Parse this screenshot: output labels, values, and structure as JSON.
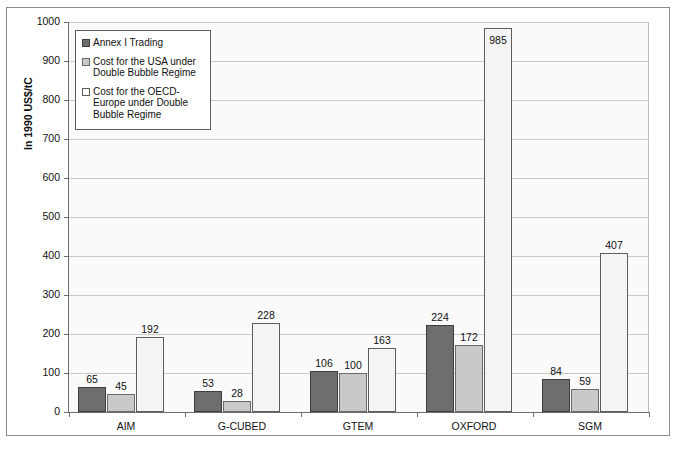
{
  "chart_data": {
    "type": "bar",
    "title": "",
    "xlabel": "",
    "ylabel": "In 1990 US$/tC",
    "ylim": [
      0,
      1000
    ],
    "ytick_step": 100,
    "yticks": [
      "0",
      "100",
      "200",
      "300",
      "400",
      "500",
      "600",
      "700",
      "800",
      "900",
      "1000"
    ],
    "grid": true,
    "legend_position": "top-left-inside",
    "categories": [
      "AIM",
      "G-CUBED",
      "GTEM",
      "OXFORD",
      "SGM"
    ],
    "series": [
      {
        "name": "Annex I Trading",
        "color": "#6e6e6e",
        "values": [
          65,
          53,
          106,
          224,
          84
        ]
      },
      {
        "name": "Cost for the USA under Double Bubble Regime",
        "color": "#c9c9c9",
        "values": [
          45,
          28,
          100,
          172,
          59
        ]
      },
      {
        "name": "Cost for the OECD-Europe under Double Bubble Regime",
        "color": "#f4f4f4",
        "values": [
          192,
          228,
          163,
          985,
          407
        ]
      }
    ],
    "data_labels": [
      [
        "65",
        "45",
        "192"
      ],
      [
        "53",
        "28",
        "228"
      ],
      [
        "106",
        "100",
        "163"
      ],
      [
        "224",
        "172",
        "985"
      ],
      [
        "84",
        "59",
        "407"
      ]
    ]
  },
  "legend": {
    "entries": [
      {
        "label": "Annex I Trading",
        "swatch": "dark-gray"
      },
      {
        "label": "Cost for the USA under Double Bubble Regime",
        "swatch": "light-gray"
      },
      {
        "label": "Cost for the OECD-Europe under Double Bubble Regime",
        "swatch": "white"
      }
    ]
  },
  "axis": {
    "y_title": "In 1990 US$/tC"
  }
}
